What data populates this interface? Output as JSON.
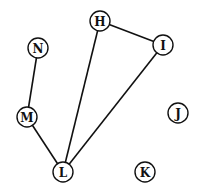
{
  "graph": {
    "nodes": [
      {
        "id": "H",
        "label": "H",
        "x": 100,
        "y": 21
      },
      {
        "id": "I",
        "label": "I",
        "x": 163,
        "y": 45
      },
      {
        "id": "N",
        "label": "N",
        "x": 38,
        "y": 48
      },
      {
        "id": "M",
        "label": "M",
        "x": 27,
        "y": 117
      },
      {
        "id": "J",
        "label": "J",
        "x": 178,
        "y": 113
      },
      {
        "id": "L",
        "label": "L",
        "x": 63,
        "y": 172
      },
      {
        "id": "K",
        "label": "K",
        "x": 145,
        "y": 172
      }
    ],
    "edges": [
      {
        "from": "H",
        "to": "I"
      },
      {
        "from": "H",
        "to": "L"
      },
      {
        "from": "I",
        "to": "L"
      },
      {
        "from": "N",
        "to": "M"
      },
      {
        "from": "M",
        "to": "L"
      }
    ],
    "node_radius": 10,
    "colors": {
      "stroke": "#111111",
      "fill": "#ffffff",
      "background": "#ffffff"
    }
  }
}
